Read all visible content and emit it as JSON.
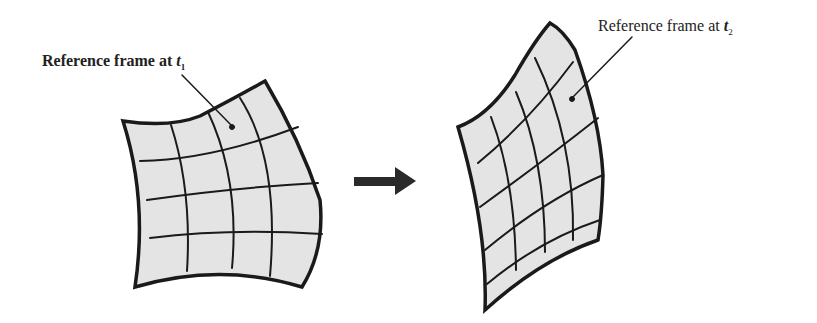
{
  "diagram": {
    "frames": [
      {
        "id": "t1",
        "label_prefix": "Reference frame at ",
        "label_var": "t",
        "label_sub": "1"
      },
      {
        "id": "t2",
        "label_prefix": "Reference frame at ",
        "label_var": "t",
        "label_sub": "2"
      }
    ],
    "arrow": {
      "direction": "right"
    },
    "colors": {
      "fill": "#e4e4e4",
      "stroke": "#1a1a1a"
    }
  }
}
